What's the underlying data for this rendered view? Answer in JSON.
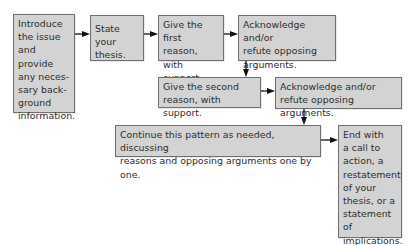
{
  "diagram": {
    "type": "flowchart",
    "title": "",
    "colors": {
      "box_fill": "#d3d3d3",
      "box_border": "#6f6f6f",
      "text": "#2e2e2e",
      "arrow": "#111111"
    },
    "nodes": [
      {
        "id": "intro",
        "label": "Introduce\nthe issue\nand provide\nany neces-\nsary back-\nground\ninformation."
      },
      {
        "id": "thesis",
        "label": "State your\nthesis."
      },
      {
        "id": "reason1",
        "label": "Give the first\nreason, with\nsupport."
      },
      {
        "id": "refute1",
        "label": "Acknowledge and/or\nrefute opposing\narguments."
      },
      {
        "id": "reason2",
        "label": "Give the second\nreason, with support."
      },
      {
        "id": "refute2",
        "label": "Acknowledge and/or\nrefute opposing arguments."
      },
      {
        "id": "continue",
        "label": "Continue this pattern as needed, discussing\nreasons and opposing arguments one by one."
      },
      {
        "id": "conclusion",
        "label": "End with\na call to\naction, a\nrestatement\nof your\nthesis, or a\nstatement of\nimplications."
      }
    ],
    "edges": [
      {
        "from": "intro",
        "to": "thesis",
        "direction": "right"
      },
      {
        "from": "thesis",
        "to": "reason1",
        "direction": "right"
      },
      {
        "from": "reason1",
        "to": "refute1",
        "direction": "right"
      },
      {
        "from": "refute1",
        "to": "reason2",
        "direction": "down"
      },
      {
        "from": "reason2",
        "to": "refute2",
        "direction": "right"
      },
      {
        "from": "refute2",
        "to": "continue",
        "direction": "down"
      },
      {
        "from": "continue",
        "to": "conclusion",
        "direction": "right"
      }
    ]
  }
}
